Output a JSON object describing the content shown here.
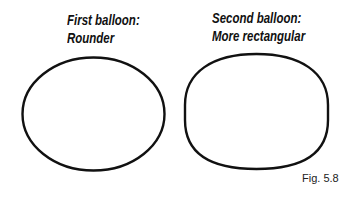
{
  "figure": {
    "label": "Fig. 5.8",
    "stroke_color": "#111111",
    "background": "#ffffff"
  },
  "balloons": [
    {
      "title_line1": "First balloon:",
      "title_line2": "Rounder",
      "shape": "ellipse"
    },
    {
      "title_line1": "Second balloon:",
      "title_line2": "More rectangular",
      "shape": "rounded-rectangle"
    }
  ]
}
